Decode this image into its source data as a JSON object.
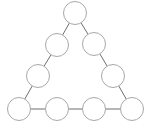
{
  "diagram": {
    "type": "triangle-circle-graph",
    "width": 152,
    "height": 128,
    "colors": {
      "background": "#ffffff",
      "circle_fill": "#ffffff",
      "circle_stroke": "#a8a8a8",
      "edge_stroke": "#6e6e6e"
    },
    "radius": 11.5,
    "nodes": [
      {
        "id": "top",
        "x": 75,
        "y": 13,
        "label": ""
      },
      {
        "id": "left-2",
        "x": 57,
        "y": 45,
        "label": ""
      },
      {
        "id": "right-2",
        "x": 94,
        "y": 44,
        "label": ""
      },
      {
        "id": "left-3",
        "x": 38,
        "y": 76,
        "label": ""
      },
      {
        "id": "right-3",
        "x": 113,
        "y": 76,
        "label": ""
      },
      {
        "id": "bottom-1",
        "x": 19,
        "y": 109,
        "label": ""
      },
      {
        "id": "bottom-2",
        "x": 57,
        "y": 109,
        "label": ""
      },
      {
        "id": "bottom-3",
        "x": 94,
        "y": 109,
        "label": ""
      },
      {
        "id": "bottom-4",
        "x": 132,
        "y": 109,
        "label": ""
      }
    ],
    "edges": [
      [
        "top",
        "left-2"
      ],
      [
        "left-2",
        "left-3"
      ],
      [
        "left-3",
        "bottom-1"
      ],
      [
        "top",
        "right-2"
      ],
      [
        "right-2",
        "right-3"
      ],
      [
        "right-3",
        "bottom-4"
      ],
      [
        "bottom-1",
        "bottom-2"
      ],
      [
        "bottom-2",
        "bottom-3"
      ],
      [
        "bottom-3",
        "bottom-4"
      ]
    ]
  }
}
